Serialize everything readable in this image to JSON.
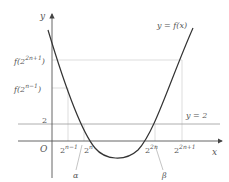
{
  "diagram": {
    "type": "function-graph",
    "axes": {
      "x_label": "x",
      "y_label": "y",
      "origin_label": "O"
    },
    "curve_label": "y = f(x)",
    "horizontal_line_label": "y = 2",
    "y_ticks": {
      "f_2_2n_plus_1": {
        "base": "f(2",
        "exp": "2n+1",
        "close": ")"
      },
      "f_2_n_minus_1": {
        "base": "f(2",
        "exp": "n−1",
        "close": ")"
      },
      "two": "2"
    },
    "x_ticks": {
      "t1": {
        "base": "2",
        "exp": "n−1"
      },
      "t2": {
        "base": "2",
        "exp": "n"
      },
      "t3": {
        "base": "2",
        "exp": "2n"
      },
      "t4": {
        "base": "2",
        "exp": "2n+1"
      }
    },
    "roots": {
      "alpha": "α",
      "beta": "β"
    },
    "colors": {
      "curve": "#333333",
      "axes": "#555555",
      "guides": "#cccccc",
      "text": "#555555"
    }
  }
}
